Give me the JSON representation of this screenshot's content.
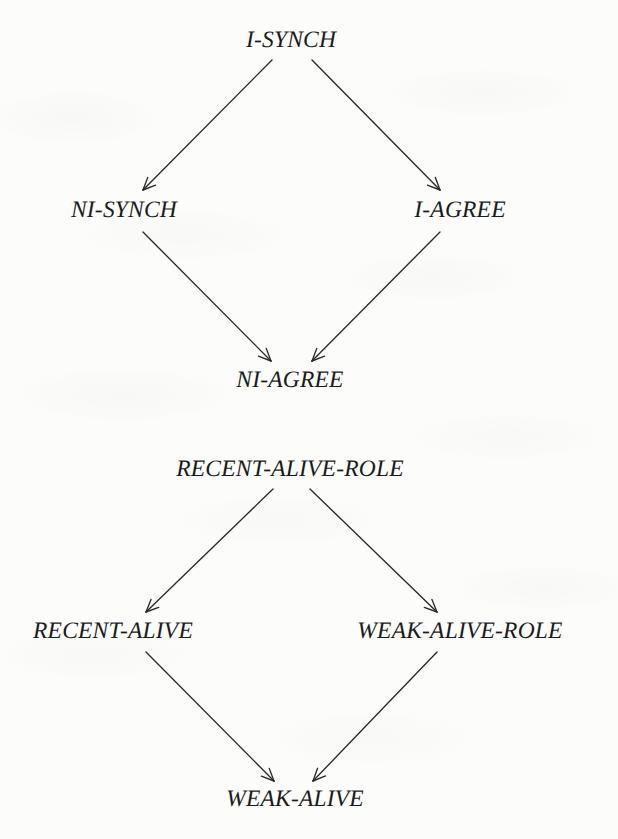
{
  "figure": {
    "kind": "lattice-hierarchy-diagram",
    "background_color": "#fcfcfb",
    "stroke_color": "#2a2a2a",
    "text_color": "#1b1b1b",
    "diagrams": [
      {
        "id": "synch-agree-lattice",
        "nodes": [
          {
            "id": "i-synch",
            "label": "I-SYNCH",
            "cx": 291,
            "cy": 41
          },
          {
            "id": "ni-synch",
            "label": "NI-SYNCH",
            "cx": 124,
            "cy": 211
          },
          {
            "id": "i-agree",
            "label": "I-AGREE",
            "cx": 460,
            "cy": 211
          },
          {
            "id": "ni-agree",
            "label": "NI-AGREE",
            "cx": 290,
            "cy": 381
          }
        ],
        "edges": [
          {
            "from": "i-synch",
            "to": "ni-synch",
            "x1": 272,
            "y1": 60,
            "x2": 143,
            "y2": 190
          },
          {
            "from": "i-synch",
            "to": "i-agree",
            "x1": 312,
            "y1": 60,
            "x2": 440,
            "y2": 190
          },
          {
            "from": "ni-synch",
            "to": "ni-agree",
            "x1": 143,
            "y1": 232,
            "x2": 271,
            "y2": 361
          },
          {
            "from": "i-agree",
            "to": "ni-agree",
            "x1": 440,
            "y1": 232,
            "x2": 312,
            "y2": 361
          }
        ]
      },
      {
        "id": "alive-role-lattice",
        "nodes": [
          {
            "id": "recent-alive-role",
            "label": "RECENT-ALIVE-ROLE",
            "cx": 290,
            "cy": 470
          },
          {
            "id": "recent-alive",
            "label": "RECENT-ALIVE",
            "cx": 113,
            "cy": 632
          },
          {
            "id": "weak-alive-role",
            "label": "WEAK-ALIVE-ROLE",
            "cx": 460,
            "cy": 632
          },
          {
            "id": "weak-alive",
            "label": "WEAK-ALIVE",
            "cx": 295,
            "cy": 800
          }
        ],
        "edges": [
          {
            "from": "recent-alive-role",
            "to": "recent-alive",
            "x1": 273,
            "y1": 489,
            "x2": 146,
            "y2": 612
          },
          {
            "from": "recent-alive-role",
            "to": "weak-alive-role",
            "x1": 310,
            "y1": 489,
            "x2": 437,
            "y2": 612
          },
          {
            "from": "recent-alive",
            "to": "weak-alive",
            "x1": 146,
            "y1": 652,
            "x2": 274,
            "y2": 781
          },
          {
            "from": "weak-alive-role",
            "to": "weak-alive",
            "x1": 437,
            "y1": 652,
            "x2": 313,
            "y2": 781
          }
        ]
      }
    ]
  }
}
